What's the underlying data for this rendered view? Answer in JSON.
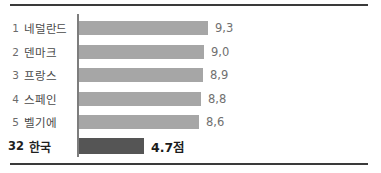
{
  "chart_data": {
    "type": "bar",
    "orientation": "horizontal",
    "title": "",
    "subtitle": "",
    "xlabel": "",
    "ylabel": "",
    "grid": false,
    "legend": null,
    "xlim": [
      0,
      10
    ],
    "unit_suffix": "점",
    "categories": [
      "네덜란드",
      "덴마크",
      "프랑스",
      "스페인",
      "벨기에",
      "한국"
    ],
    "values": [
      9.3,
      9.0,
      8.9,
      8.8,
      8.6,
      4.7
    ],
    "ranks": [
      "1",
      "2",
      "3",
      "4",
      "5",
      "32"
    ],
    "value_labels": [
      "9,3",
      "9,0",
      "8,9",
      "8,8",
      "8,6",
      "4.7점"
    ],
    "highlight_index": 5,
    "rows": [
      {
        "rank": "1",
        "category": "네덜란드",
        "value": 9.3,
        "label": "9,3",
        "highlight": false
      },
      {
        "rank": "2",
        "category": "덴마크",
        "value": 9.0,
        "label": "9,0",
        "highlight": false
      },
      {
        "rank": "3",
        "category": "프랑스",
        "value": 8.9,
        "label": "8,9",
        "highlight": false
      },
      {
        "rank": "4",
        "category": "스페인",
        "value": 8.8,
        "label": "8,8",
        "highlight": false
      },
      {
        "rank": "5",
        "category": "벨기에",
        "value": 8.6,
        "label": "8,6",
        "highlight": false
      },
      {
        "rank": "32",
        "category": "한국",
        "value": 4.7,
        "label": "4.7점",
        "highlight": true
      }
    ],
    "colors": {
      "bar": "#a6a6a6",
      "bar_highlight": "#555555",
      "axis": "#7d7d7d",
      "rule": "#3a3a3a",
      "label_text": "#4a4a4a",
      "value_text": "#707070",
      "highlight_text": "#1b1b1b",
      "background": "#ffffff"
    }
  }
}
